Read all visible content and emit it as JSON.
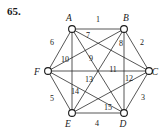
{
  "problem": {
    "number": "65."
  },
  "figure": {
    "type": "complete-graph",
    "vertices": [
      {
        "id": "A",
        "label": "A",
        "x": 72,
        "y": 29,
        "label_x": 69,
        "label_y": 21
      },
      {
        "id": "B",
        "label": "B",
        "x": 124,
        "y": 29,
        "label_x": 126,
        "label_y": 21
      },
      {
        "id": "C",
        "label": "C",
        "x": 149,
        "y": 71,
        "label_x": 155,
        "label_y": 75
      },
      {
        "id": "D",
        "label": "D",
        "x": 124,
        "y": 113,
        "label_x": 123,
        "label_y": 127
      },
      {
        "id": "E",
        "label": "E",
        "x": 72,
        "y": 113,
        "label_x": 68,
        "label_y": 127
      },
      {
        "id": "F",
        "label": "F",
        "x": 48,
        "y": 71,
        "label_x": 37,
        "label_y": 75
      }
    ],
    "edges": [
      {
        "id": "e1",
        "label": "1",
        "from": "A",
        "to": "B",
        "label_x": 98,
        "label_y": 22
      },
      {
        "id": "e2",
        "label": "2",
        "from": "B",
        "to": "C",
        "label_x": 142,
        "label_y": 45
      },
      {
        "id": "e3",
        "label": "3",
        "from": "C",
        "to": "D",
        "label_x": 143,
        "label_y": 100
      },
      {
        "id": "e4",
        "label": "4",
        "from": "D",
        "to": "E",
        "label_x": 97,
        "label_y": 126
      },
      {
        "id": "e5",
        "label": "5",
        "from": "E",
        "to": "F",
        "label_x": 52,
        "label_y": 101
      },
      {
        "id": "e6",
        "label": "6",
        "from": "F",
        "to": "A",
        "label_x": 52,
        "label_y": 45
      },
      {
        "id": "e7",
        "label": "7",
        "from": "A",
        "to": "C",
        "label_x": 88,
        "label_y": 38
      },
      {
        "id": "e8",
        "label": "8",
        "from": "B",
        "to": "E",
        "label_x": 121,
        "label_y": 46
      },
      {
        "id": "e9",
        "label": "9",
        "from": "A",
        "to": "D",
        "label_x": 91,
        "label_y": 61
      },
      {
        "id": "e10",
        "label": "10",
        "from": "F",
        "to": "B",
        "label_x": 65,
        "label_y": 62
      },
      {
        "id": "e11",
        "label": "11",
        "from": "F",
        "to": "C",
        "label_x": 113,
        "label_y": 72
      },
      {
        "id": "e12",
        "label": "12",
        "from": "B",
        "to": "D",
        "label_x": 129,
        "label_y": 81
      },
      {
        "id": "e13",
        "label": "13",
        "from": "F",
        "to": "D",
        "label_x": 89,
        "label_y": 82
      },
      {
        "id": "e14",
        "label": "14",
        "from": "A",
        "to": "E",
        "label_x": 75,
        "label_y": 94
      },
      {
        "id": "e15",
        "label": "15",
        "from": "E",
        "to": "C",
        "label_x": 108,
        "label_y": 110
      }
    ],
    "colors": {
      "stroke": "#2b2b2b",
      "node_fill": "#ffffff",
      "node_stroke": "#1a1a1a",
      "text": "#1a1a1a",
      "background": "#ffffff"
    },
    "node_radius": 3.4
  }
}
